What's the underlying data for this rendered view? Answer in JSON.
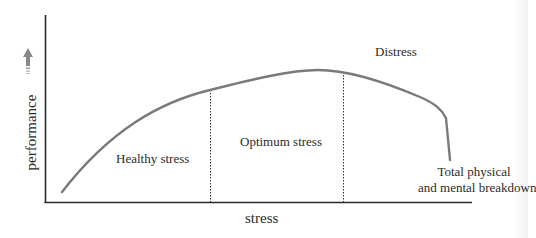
{
  "diagram": {
    "type": "line",
    "title": "",
    "xlabel": "stress",
    "ylabel": "performance",
    "colors": {
      "curve": "#7a7a7a",
      "axis": "#2b2b2b",
      "arrow": "#888888",
      "divider": "#333333",
      "text": "#2b2b2b"
    },
    "regions": [
      {
        "label": "Healthy stress"
      },
      {
        "label": "Optimum stress"
      },
      {
        "label": "Distress"
      }
    ],
    "annotation": {
      "line1": "Total physical",
      "line2": "and mental breakdown"
    }
  }
}
